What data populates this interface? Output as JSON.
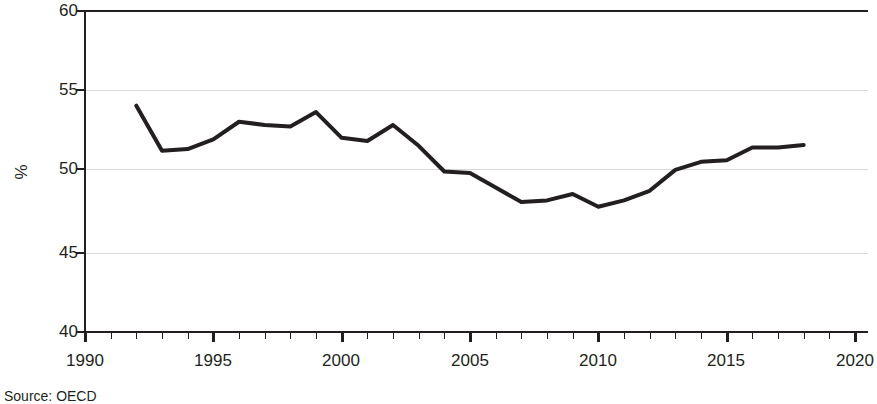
{
  "chart_data": {
    "type": "line",
    "title": "",
    "subtitle": "",
    "xlabel": "",
    "ylabel": "%",
    "xlim": [
      1990,
      2020
    ],
    "ylim": [
      40,
      60
    ],
    "y_ticks": [
      40,
      45,
      50,
      55,
      60
    ],
    "x_ticks": [
      1990,
      1995,
      2000,
      2005,
      2010,
      2015,
      2020
    ],
    "x_minor_tick_step": 1,
    "grid": "horizontal",
    "legend": "none",
    "line_color": "#231f20",
    "line_width_px": 4,
    "source_note": "Source: OECD",
    "x": [
      1992,
      1993,
      1994,
      1995,
      1996,
      1997,
      1998,
      1999,
      2000,
      2001,
      2002,
      2003,
      2004,
      2005,
      2006,
      2007,
      2008,
      2009,
      2010,
      2011,
      2012,
      2013,
      2014,
      2015,
      2016,
      2017,
      2018
    ],
    "series": [
      {
        "name": "",
        "values": [
          54.1,
          51.3,
          51.4,
          52.0,
          53.1,
          52.9,
          52.8,
          53.7,
          52.1,
          51.9,
          52.9,
          51.6,
          50.0,
          49.9,
          49.0,
          48.1,
          48.2,
          48.6,
          47.8,
          48.2,
          48.8,
          50.1,
          50.6,
          50.7,
          51.5,
          51.5,
          51.65
        ]
      }
    ]
  },
  "axis": {
    "y_tick_labels": [
      "60",
      "55",
      "50",
      "45",
      "40"
    ],
    "x_tick_labels": [
      "1990",
      "1995",
      "2000",
      "2005",
      "2010",
      "2015",
      "2020"
    ],
    "y_axis_title": "%"
  },
  "footer": {
    "source": "Source: OECD"
  }
}
